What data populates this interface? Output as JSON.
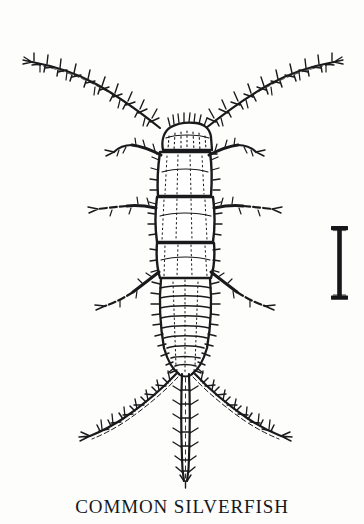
{
  "plate": {
    "caption": "COMMON SILVERFISH",
    "background_color": "#fdfdfc",
    "ink_color": "#1a1a1c",
    "width": 364,
    "height": 524
  },
  "figure": {
    "name": "common-silverfish",
    "orientation": "dorsal view, head up",
    "parts": {
      "head": "head",
      "antenna_left": "left-antenna",
      "antenna_right": "right-antenna",
      "thorax": "thorax",
      "abdomen": "abdomen",
      "legs_left": "left-legs",
      "legs_right": "right-legs",
      "cercus_left": "left-cercus",
      "cercus_right": "right-cercus",
      "terminal_filament": "terminal-filament"
    }
  },
  "scale_bar": {
    "name": "scale-bar",
    "shape": "serif-i-bar",
    "label": "",
    "color": "#171719"
  }
}
